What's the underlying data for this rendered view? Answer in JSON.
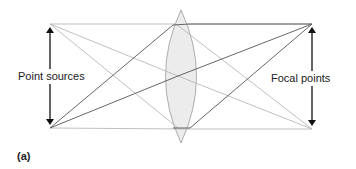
{
  "diagram": {
    "left_label": "Point sources",
    "right_label": "Focal points",
    "panel_label": "(a)"
  },
  "colors": {
    "dark_ray": "#555555",
    "light_ray": "#b5b5b5",
    "lens_fill": "#ececec",
    "lens_stroke": "#999999",
    "arrow": "#111111"
  }
}
